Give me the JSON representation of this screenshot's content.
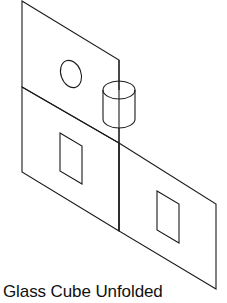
{
  "diagram": {
    "caption": "Glass Cube Unfolded",
    "stroke_color": "#1a1a1a",
    "background": "#ffffff",
    "panels": [
      {
        "name": "top-panel",
        "points": "22,1 119,60 119,143 22,87"
      },
      {
        "name": "left-panel",
        "points": "22,87 119,143 119,231 22,172"
      },
      {
        "name": "right-panel",
        "points": "119,143 216,204 216,289 119,231"
      }
    ],
    "features": {
      "circle_hole": {
        "cx": 71,
        "cy": 74,
        "rx": 10,
        "ry": 14,
        "rotate": -20
      },
      "cylinder": {
        "cx": 119,
        "top_cy": 90,
        "bottom_cy": 119,
        "rx": 16,
        "ry": 9
      },
      "left_window": {
        "points": "60,133 82,146 82,184 60,171"
      },
      "right_window": {
        "points": "157,191 179,204 179,243 157,230"
      }
    }
  }
}
